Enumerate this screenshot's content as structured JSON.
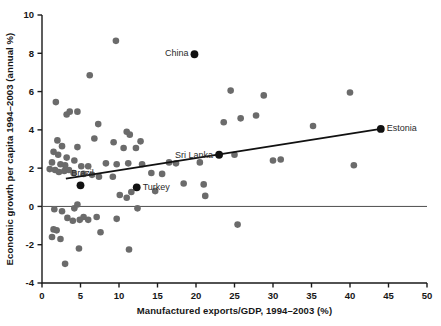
{
  "chart_data": {
    "type": "scatter",
    "title": "",
    "xlabel": "Manufactured exports/GDP, 1994–2003 (%)",
    "ylabel": "Economic growth per capita 1994–2003 (annual %)",
    "xlim": [
      0,
      50
    ],
    "ylim": [
      -4,
      10
    ],
    "xticks": [
      0,
      5,
      10,
      15,
      20,
      25,
      30,
      35,
      40,
      45,
      50
    ],
    "yticks": [
      -4,
      -2,
      0,
      2,
      4,
      6,
      8,
      10
    ],
    "xtick_labels": [
      "0",
      "5",
      "10",
      "15",
      "20",
      "25",
      "30",
      "35",
      "40",
      "45",
      "50"
    ],
    "ytick_labels": [
      "-4",
      "-2",
      "0",
      "2",
      "4",
      "6",
      "8",
      "10"
    ],
    "grid": false,
    "legend": false,
    "zero_line": true,
    "marker_color": "#6b6b6b",
    "highlight_color": "#111111",
    "trendline_color": "#111111",
    "axis_color": "#1a1a1a",
    "trendline": {
      "x_start": 3.1,
      "y_start": 1.45,
      "x_end": 44.0,
      "y_end": 4.05
    },
    "annotations": [
      {
        "label": "China",
        "x": 19.8,
        "y": 7.95,
        "dx": -6,
        "dy": 2,
        "anchor": "end"
      },
      {
        "label": "Sri Lanka",
        "x": 23.0,
        "y": 2.7,
        "dx": -6,
        "dy": 3,
        "anchor": "end"
      },
      {
        "label": "Estonia",
        "x": 44.0,
        "y": 4.05,
        "dx": 6,
        "dy": 2,
        "anchor": "start"
      },
      {
        "label": "Brazil",
        "x": 5.0,
        "y": 1.1,
        "dx": 2,
        "dy": -9,
        "anchor": "middle"
      },
      {
        "label": "Turkey",
        "x": 12.3,
        "y": 1.0,
        "dx": 6,
        "dy": 3,
        "anchor": "start"
      }
    ],
    "highlight_points": [
      {
        "name": "China",
        "x": 19.8,
        "y": 7.95
      },
      {
        "name": "Sri Lanka",
        "x": 23.0,
        "y": 2.7
      },
      {
        "name": "Estonia",
        "x": 44.0,
        "y": 4.05
      },
      {
        "name": "Brazil",
        "x": 5.0,
        "y": 1.1
      },
      {
        "name": "Turkey",
        "x": 12.3,
        "y": 1.0
      }
    ],
    "points": [
      {
        "x": 9.6,
        "y": 8.65
      },
      {
        "x": 6.2,
        "y": 6.85
      },
      {
        "x": 24.5,
        "y": 6.05
      },
      {
        "x": 40.0,
        "y": 5.95
      },
      {
        "x": 28.8,
        "y": 5.8
      },
      {
        "x": 1.8,
        "y": 5.45
      },
      {
        "x": 3.6,
        "y": 4.95
      },
      {
        "x": 4.6,
        "y": 4.95
      },
      {
        "x": 27.8,
        "y": 4.75
      },
      {
        "x": 3.2,
        "y": 4.8
      },
      {
        "x": 25.8,
        "y": 4.6
      },
      {
        "x": 23.6,
        "y": 4.4
      },
      {
        "x": 7.3,
        "y": 4.3
      },
      {
        "x": 35.2,
        "y": 4.2
      },
      {
        "x": 11.0,
        "y": 3.9
      },
      {
        "x": 11.4,
        "y": 3.75
      },
      {
        "x": 2.0,
        "y": 3.45
      },
      {
        "x": 6.8,
        "y": 3.55
      },
      {
        "x": 12.8,
        "y": 3.4
      },
      {
        "x": 9.3,
        "y": 3.35
      },
      {
        "x": 2.6,
        "y": 3.15
      },
      {
        "x": 4.6,
        "y": 3.1
      },
      {
        "x": 12.2,
        "y": 3.05
      },
      {
        "x": 10.6,
        "y": 3.05
      },
      {
        "x": 1.5,
        "y": 2.85
      },
      {
        "x": 2.1,
        "y": 2.7
      },
      {
        "x": 25.0,
        "y": 2.7
      },
      {
        "x": 31.0,
        "y": 2.45
      },
      {
        "x": 30.0,
        "y": 2.4
      },
      {
        "x": 40.5,
        "y": 2.15
      },
      {
        "x": 3.2,
        "y": 2.55
      },
      {
        "x": 4.2,
        "y": 2.4
      },
      {
        "x": 1.3,
        "y": 2.3
      },
      {
        "x": 2.4,
        "y": 2.2
      },
      {
        "x": 3.0,
        "y": 2.15
      },
      {
        "x": 5.1,
        "y": 2.1
      },
      {
        "x": 6.0,
        "y": 2.1
      },
      {
        "x": 8.3,
        "y": 2.25
      },
      {
        "x": 9.7,
        "y": 2.2
      },
      {
        "x": 11.2,
        "y": 2.25
      },
      {
        "x": 13.0,
        "y": 2.2
      },
      {
        "x": 16.5,
        "y": 2.3
      },
      {
        "x": 17.4,
        "y": 2.25
      },
      {
        "x": 20.5,
        "y": 2.3
      },
      {
        "x": 1.0,
        "y": 1.95
      },
      {
        "x": 1.7,
        "y": 1.9
      },
      {
        "x": 2.2,
        "y": 1.8
      },
      {
        "x": 2.9,
        "y": 1.85
      },
      {
        "x": 3.5,
        "y": 1.9
      },
      {
        "x": 4.1,
        "y": 1.75
      },
      {
        "x": 5.4,
        "y": 1.7
      },
      {
        "x": 6.5,
        "y": 1.65
      },
      {
        "x": 7.4,
        "y": 1.55
      },
      {
        "x": 9.2,
        "y": 1.55
      },
      {
        "x": 14.2,
        "y": 1.75
      },
      {
        "x": 15.6,
        "y": 1.7
      },
      {
        "x": 18.4,
        "y": 1.2
      },
      {
        "x": 21.0,
        "y": 1.15
      },
      {
        "x": 14.7,
        "y": 0.8
      },
      {
        "x": 11.6,
        "y": 0.75
      },
      {
        "x": 10.1,
        "y": 0.6
      },
      {
        "x": 11.0,
        "y": 0.45
      },
      {
        "x": 21.2,
        "y": 0.55
      },
      {
        "x": 1.6,
        "y": -0.15
      },
      {
        "x": 2.6,
        "y": -0.25
      },
      {
        "x": 4.2,
        "y": -0.1
      },
      {
        "x": 4.6,
        "y": 0.1
      },
      {
        "x": 12.4,
        "y": -0.1
      },
      {
        "x": 3.3,
        "y": -0.6
      },
      {
        "x": 4.0,
        "y": -0.75
      },
      {
        "x": 4.9,
        "y": -0.7
      },
      {
        "x": 5.4,
        "y": -0.55
      },
      {
        "x": 6.0,
        "y": -0.7
      },
      {
        "x": 7.1,
        "y": -0.55
      },
      {
        "x": 9.7,
        "y": -0.65
      },
      {
        "x": 1.5,
        "y": -1.2
      },
      {
        "x": 1.9,
        "y": -1.25
      },
      {
        "x": 1.3,
        "y": -1.6
      },
      {
        "x": 2.4,
        "y": -1.7
      },
      {
        "x": 7.6,
        "y": -1.35
      },
      {
        "x": 4.8,
        "y": -2.2
      },
      {
        "x": 11.3,
        "y": -2.25
      },
      {
        "x": 3.0,
        "y": -3.0
      },
      {
        "x": 25.4,
        "y": -0.95
      }
    ]
  }
}
